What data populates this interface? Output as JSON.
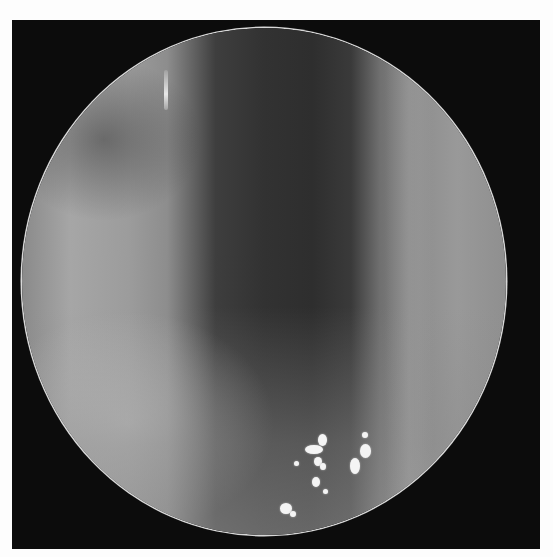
{
  "image": {
    "description": "Grayscale endoscopic view inside a circular scope aperture on a black square frame",
    "colors": {
      "page_background": "#fdfdfd",
      "frame": "#0c0c0c",
      "scope_rim": "#d8d8d8",
      "specular_highlight": "#f4f4f4"
    },
    "highlights": [
      {
        "x": 318,
        "y": 434,
        "w": 9,
        "h": 12
      },
      {
        "x": 305,
        "y": 445,
        "w": 18,
        "h": 9
      },
      {
        "x": 314,
        "y": 457,
        "w": 8,
        "h": 9
      },
      {
        "x": 320,
        "y": 463,
        "w": 6,
        "h": 7
      },
      {
        "x": 312,
        "y": 477,
        "w": 8,
        "h": 10
      },
      {
        "x": 323,
        "y": 489,
        "w": 5,
        "h": 5
      },
      {
        "x": 294,
        "y": 461,
        "w": 5,
        "h": 5
      },
      {
        "x": 362,
        "y": 432,
        "w": 6,
        "h": 6
      },
      {
        "x": 360,
        "y": 444,
        "w": 11,
        "h": 14
      },
      {
        "x": 350,
        "y": 458,
        "w": 10,
        "h": 16
      },
      {
        "x": 280,
        "y": 503,
        "w": 12,
        "h": 11
      },
      {
        "x": 290,
        "y": 511,
        "w": 6,
        "h": 6
      }
    ]
  }
}
